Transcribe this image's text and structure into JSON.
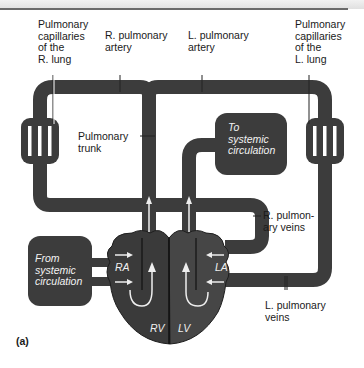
{
  "figure": {
    "panel_label": "(a)",
    "colors": {
      "vessel": "#3c3c3c",
      "heart_right": "#3a3a3a",
      "heart_left": "#464646",
      "background": "#ffffff",
      "label_text": "#1a1a1a",
      "inner_text": "#f2f2f2"
    }
  },
  "labels": {
    "cap_r": "Pulmonary\ncapillaries\nof the\nR. lung",
    "r_artery": "R. pulmonary\nartery",
    "l_artery": "L. pulmonary\nartery",
    "cap_l": "Pulmonary\ncapillaries\nof the\nL. lung",
    "trunk": "Pulmonary\ntrunk",
    "to_systemic": "To\nsystemic\ncirculation",
    "r_veins": "R. pulmon-\nary veins",
    "from_systemic": "From\nsystemic\ncirculation",
    "l_veins": "L. pulmonary\nveins"
  },
  "chambers": {
    "ra": "RA",
    "la": "LA",
    "rv": "RV",
    "lv": "LV"
  }
}
